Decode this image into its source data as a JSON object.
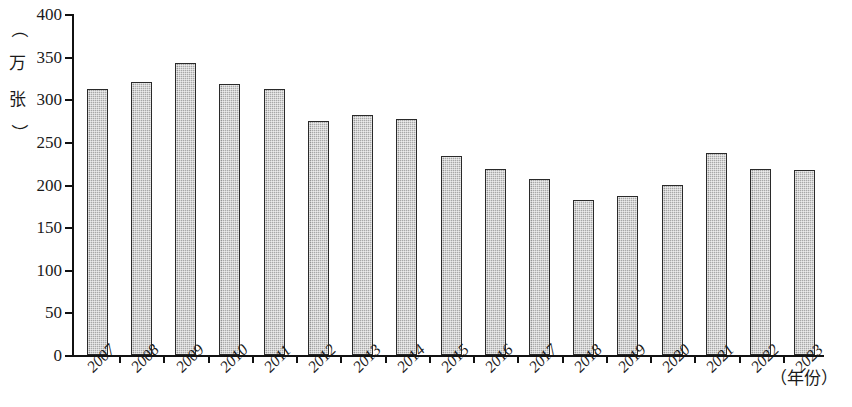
{
  "chart_data": {
    "type": "bar",
    "title": "",
    "subtitle": "",
    "xlabel": "（年份）",
    "ylabel": "（万张）",
    "ylim": [
      0,
      400
    ],
    "ytick_labels": [
      "0",
      "50",
      "100",
      "150",
      "200",
      "250",
      "300",
      "350",
      "400"
    ],
    "ytick_values": [
      0,
      50,
      100,
      150,
      200,
      250,
      300,
      350,
      400
    ],
    "grid": false,
    "legend": null,
    "categories": [
      "2007",
      "2008",
      "2009",
      "2010",
      "2011",
      "2012",
      "2013",
      "2014",
      "2015",
      "2016",
      "2017",
      "2018",
      "2019",
      "2020",
      "2021",
      "2022",
      "2023"
    ],
    "values": [
      312,
      320,
      342,
      318,
      312,
      274,
      281,
      277,
      233,
      218,
      206,
      182,
      186,
      199,
      237,
      218,
      217
    ],
    "series": [
      {
        "name": "",
        "values": [
          312,
          320,
          342,
          318,
          312,
          274,
          281,
          277,
          233,
          218,
          206,
          182,
          186,
          199,
          237,
          218,
          217
        ]
      }
    ],
    "bar_fill_color": "#a8a8a8",
    "bar_border_color": "#2a2a2a",
    "axis_color": "#111111"
  },
  "axis": {
    "y_unit_open_paren": "（",
    "y_unit_char1": "万",
    "y_unit_char2": "张",
    "y_unit_close_paren": "）",
    "x_unit": "（年份）"
  }
}
